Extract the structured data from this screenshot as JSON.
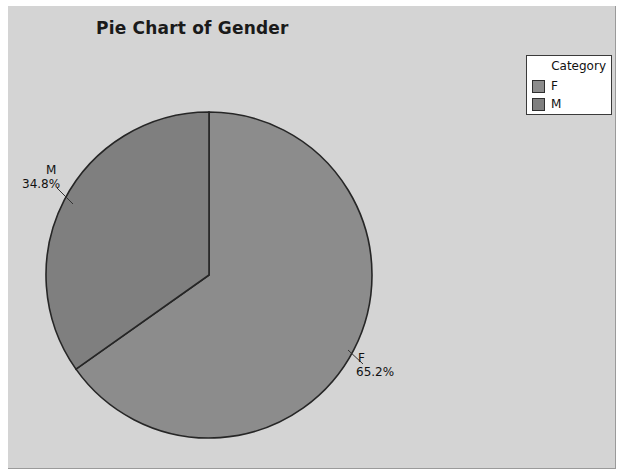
{
  "figure": {
    "background": "#d4d4d4",
    "border_color": "#9a9a9a"
  },
  "title": "Pie Chart of Gender",
  "legend": {
    "title": "Category",
    "items": [
      {
        "label": "F",
        "color": "#8c8c8c"
      },
      {
        "label": "M",
        "color": "#7f7f7f"
      }
    ]
  },
  "labels": {
    "m": {
      "category": "M",
      "percent": "34.8%"
    },
    "f": {
      "category": "F",
      "percent": "65.2%"
    }
  },
  "chart_data": {
    "type": "pie",
    "title": "Pie Chart of Gender",
    "categories": [
      "F",
      "M"
    ],
    "values": [
      65.2,
      34.8
    ],
    "value_labels": [
      "65.2%",
      "34.8%"
    ],
    "colors": [
      "#8c8c8c",
      "#7f7f7f"
    ],
    "legend_title": "Category",
    "legend_position": "top-right",
    "start_angle_deg": 90,
    "direction": "clockwise",
    "grid": false,
    "center_px": [
      209,
      275
    ],
    "radius_px": 163,
    "slice_edge_color": "#262626"
  }
}
